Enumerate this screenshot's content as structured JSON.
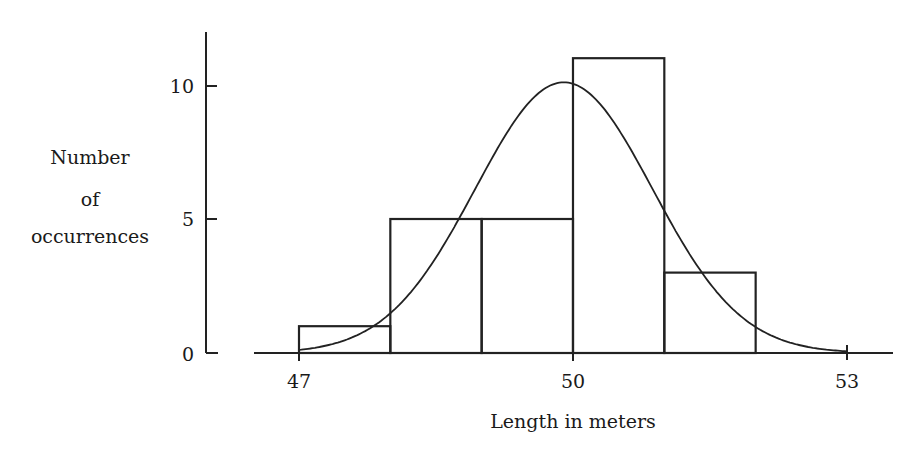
{
  "chart_data": {
    "type": "bar",
    "subtype": "histogram_with_normal_curve",
    "title": "",
    "xlabel": "Length in meters",
    "ylabel": [
      "Number",
      "of",
      "occurrences"
    ],
    "x_ticks": [
      47,
      50,
      53
    ],
    "y_ticks": [
      0,
      5,
      10
    ],
    "xlim": [
      47,
      53
    ],
    "ylim": [
      0,
      12
    ],
    "grid": false,
    "legend": null,
    "bins": [
      {
        "from": 47,
        "to": 48,
        "count": 1
      },
      {
        "from": 48,
        "to": 49,
        "count": 5
      },
      {
        "from": 49,
        "to": 50,
        "count": 5
      },
      {
        "from": 50,
        "to": 51,
        "count": 11
      },
      {
        "from": 51,
        "to": 52,
        "count": 3
      }
    ],
    "categories": [
      "47-48",
      "48-49",
      "49-50",
      "50-51",
      "51-52"
    ],
    "values": [
      1,
      5,
      5,
      11,
      3
    ],
    "overlay_curve": {
      "type": "normal",
      "mean": 49.9,
      "sd": 0.97,
      "peak": 10.1,
      "x_range": [
        47,
        53
      ]
    }
  },
  "labels": {
    "x_axis_title": "Length in meters",
    "y_axis_title_lines": [
      "Number",
      "of",
      "occurrences"
    ],
    "x_tick_labels": [
      "47",
      "50",
      "53"
    ],
    "y_tick_labels": [
      "0",
      "5",
      "10"
    ]
  }
}
